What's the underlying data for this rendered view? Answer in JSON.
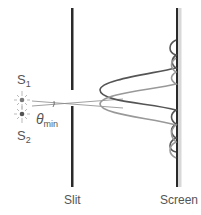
{
  "diagram": {
    "title": "",
    "labels": {
      "source1": "S",
      "source1_sub": "1",
      "source2": "S",
      "source2_sub": "2",
      "angle": "θ",
      "angle_sub": "min",
      "slit": "Slit",
      "screen": "Screen"
    },
    "colors": {
      "barrier": "#2a2a2a",
      "rays": "#888888",
      "source_glow": "#bbbbbb",
      "source_dot": "#555555",
      "curve_dark": "#555555",
      "curve_light": "#9a9a9a",
      "screen_strip": "#d8d8d8",
      "text": "#555555"
    }
  }
}
